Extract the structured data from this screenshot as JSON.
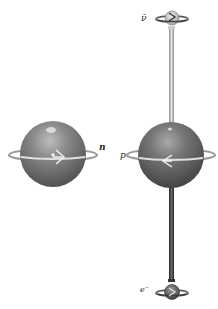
{
  "diagram": {
    "type": "beta-decay-spin-diagram",
    "particles": [
      {
        "id": "neutron",
        "label": "n",
        "kind": "large-sphere",
        "color": "#7d7d7d",
        "spin": "right"
      },
      {
        "id": "proton",
        "label": "p",
        "kind": "large-sphere",
        "color": "#6e6e6e",
        "spin": "left"
      },
      {
        "id": "antineutrino",
        "label": "ν̄",
        "kind": "small-sphere",
        "color": "#b5b5b5",
        "spin": "right"
      },
      {
        "id": "electron",
        "label": "e⁻",
        "kind": "small-sphere",
        "color": "#5e5e5e",
        "spin": "right"
      }
    ],
    "connections": [
      {
        "from": "proton",
        "to": "antineutrino",
        "color": "#b0b0b0",
        "style": "light-tube"
      },
      {
        "from": "proton",
        "to": "electron",
        "color": "#3a3a3a",
        "style": "dark-tube"
      }
    ]
  },
  "labels": {
    "neutron": "n",
    "proton": "p",
    "antineutrino": "ν̄",
    "electron": "e⁻"
  }
}
